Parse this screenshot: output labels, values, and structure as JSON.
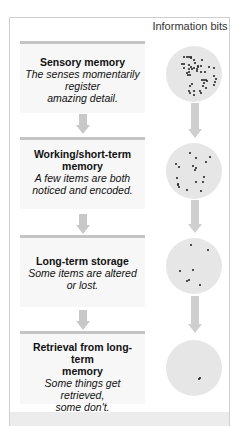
{
  "diagram": {
    "column_title": "Information bits",
    "stages": [
      {
        "title": "Sensory memory",
        "desc_lines": [
          "The senses momentarily",
          "register",
          "amazing detail."
        ],
        "dot_count": 48
      },
      {
        "title_lines": [
          "Working/short-term",
          "memory"
        ],
        "desc_lines": [
          "A few items are both",
          "noticed and encoded."
        ],
        "dot_count": 18
      },
      {
        "title": "Long-term storage",
        "desc_lines": [
          "Some items are altered",
          "or lost."
        ],
        "dot_count": 7
      },
      {
        "title_lines": [
          "Retrieval from long-term",
          "memory"
        ],
        "desc_lines": [
          "Some things get",
          "retrieved,",
          "some don't."
        ],
        "dot_count": 2
      }
    ],
    "colors": {
      "frame_border": "#cfcfcf",
      "stage_bg": "#f7f7f7",
      "stage_topline": "#c4c4c4",
      "arrow": "#c8c8c8",
      "circle": "#e6e6e6",
      "dot": "#1a1a1a",
      "bottom_band": "#ececec"
    }
  }
}
